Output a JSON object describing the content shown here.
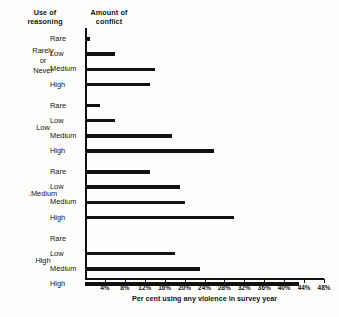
{
  "headers": {
    "use_of_reasoning": "Use of\nreasoning",
    "use_of_reasoning_line1": "Use of",
    "use_of_reasoning_line2": "reasoning",
    "amount_of_conflict_line1": "Amount of",
    "amount_of_conflict_line2": "conflict"
  },
  "axis": {
    "x_title": "Per cent using any violence in survey year",
    "tick_labels": [
      "4%",
      "8%",
      "12%",
      "16%",
      "20%",
      "24%",
      "28%",
      "32%",
      "36%",
      "40%",
      "44%",
      "48%"
    ],
    "tick_values": [
      4,
      8,
      12,
      16,
      20,
      24,
      28,
      32,
      36,
      40,
      44,
      48
    ],
    "x_min": 0,
    "x_max": 48
  },
  "groups": [
    {
      "label": "Rarely\nor\nNever",
      "label_line1": "Rarely",
      "label_line2": "or",
      "label_line3": "Never",
      "bars": [
        {
          "category": "Rare",
          "value": 1
        },
        {
          "category": "Low",
          "value": 6
        },
        {
          "category": "Medium",
          "value": 14
        },
        {
          "category": "High",
          "value": 13
        }
      ]
    },
    {
      "label": "Low",
      "label_line1": "Low",
      "bars": [
        {
          "category": "Rare",
          "value": 3
        },
        {
          "category": "Low",
          "value": 6
        },
        {
          "category": "Medium",
          "value": 17.5
        },
        {
          "category": "High",
          "value": 26
        }
      ]
    },
    {
      "label": ".Medium",
      "label_line1": ".Medium",
      "bars": [
        {
          "category": "Rare",
          "value": 13
        },
        {
          "category": "Low",
          "value": 19
        },
        {
          "category": "Medium",
          "value": 20
        },
        {
          "category": "High",
          "value": 30
        }
      ]
    },
    {
      "label": "High",
      "label_line1": "High",
      "bars": [
        {
          "category": "Rare",
          "value": 0
        },
        {
          "category": "Low",
          "value": 18
        },
        {
          "category": "Medium",
          "value": 23
        },
        {
          "category": "High",
          "value": 43
        }
      ]
    }
  ],
  "colors": {
    "bar": "#111111",
    "axis": "#111111",
    "background": "#fdfdfb",
    "text": "#131313"
  },
  "chart_data": {
    "type": "bar",
    "orientation": "horizontal",
    "title": "",
    "xlabel": "Per cent using any violence in survey year",
    "ylabel": "",
    "xlim": [
      0,
      48
    ],
    "grid": false,
    "legend": "none",
    "group_axis_label": "Use of reasoning",
    "category_axis_label": "Amount of conflict",
    "groups": [
      "Rarely or Never",
      "Low",
      "Medium",
      "High"
    ],
    "categories": [
      "Rare",
      "Low",
      "Medium",
      "High"
    ],
    "values": [
      [
        1,
        6,
        14,
        13
      ],
      [
        3,
        6,
        17.5,
        26
      ],
      [
        13,
        19,
        20,
        30
      ],
      [
        0,
        18,
        23,
        43
      ]
    ],
    "series": [
      {
        "name": "Rarely or Never",
        "values": [
          1,
          6,
          14,
          13
        ]
      },
      {
        "name": "Low",
        "values": [
          3,
          6,
          17.5,
          26
        ]
      },
      {
        "name": "Medium",
        "values": [
          13,
          19,
          20,
          30
        ]
      },
      {
        "name": "High",
        "values": [
          0,
          18,
          23,
          43
        ]
      }
    ],
    "xticks": [
      4,
      8,
      12,
      16,
      20,
      24,
      28,
      32,
      36,
      40,
      44,
      48
    ],
    "xticklabels": [
      "4%",
      "8%",
      "12%",
      "16%",
      "20%",
      "24%",
      "28%",
      "32%",
      "36%",
      "40%",
      "44%",
      "48%"
    ]
  }
}
